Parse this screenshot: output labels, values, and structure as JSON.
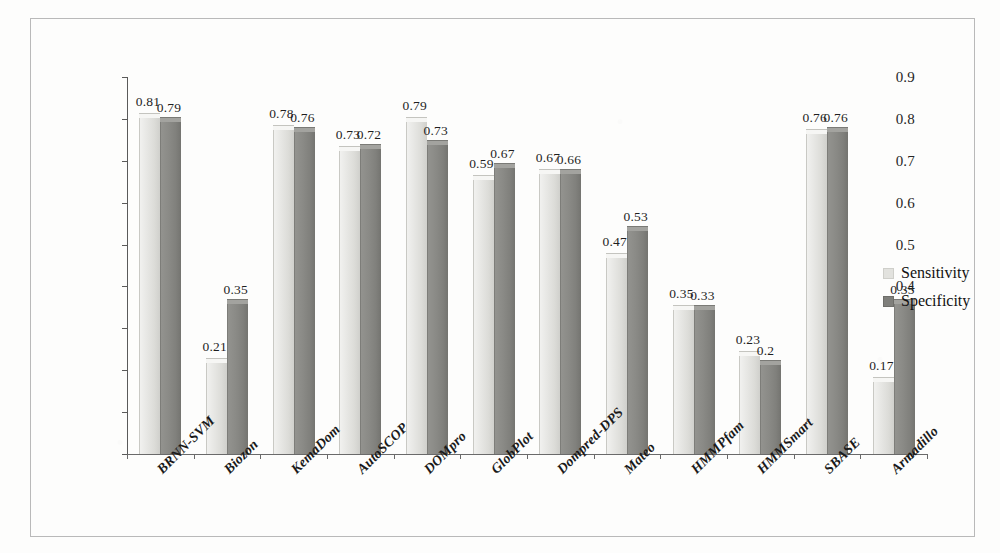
{
  "chart_data": {
    "type": "bar",
    "title": "",
    "xlabel": "",
    "ylabel": "",
    "ylim": [
      0,
      0.9
    ],
    "ytick_labels": [
      "0.9",
      "0.8",
      "0.7",
      "0.6",
      "0.5",
      "0.4",
      "0.3",
      "0.2",
      "0.1",
      "0"
    ],
    "ytick_values": [
      0.9,
      0.8,
      0.7,
      0.6,
      0.5,
      0.4,
      0.3,
      0.2,
      0.1,
      0
    ],
    "grid": false,
    "legend_position": "right",
    "categories": [
      "BRNN-SVM",
      "Biozon",
      "KemaDom",
      "AutoSCOP",
      "DOMpro",
      "GlobPlot",
      "Dompred-DPS",
      "Mateo",
      "HMMPfam",
      "HMMSmart",
      "SBASE",
      "Armadillo"
    ],
    "series": [
      {
        "name": "Sensitivity",
        "color": "#e6e6e3",
        "values": [
          0.81,
          0.21,
          0.78,
          0.73,
          0.79,
          0.59,
          0.67,
          0.47,
          0.35,
          0.23,
          0.76,
          0.17
        ],
        "bar_heights": [
          0.815,
          0.23,
          0.785,
          0.735,
          0.805,
          0.665,
          0.68,
          0.48,
          0.355,
          0.245,
          0.775,
          0.185
        ]
      },
      {
        "name": "Specificity",
        "color": "#8a8a86",
        "values": [
          0.79,
          0.35,
          0.76,
          0.72,
          0.73,
          0.67,
          0.66,
          0.53,
          0.33,
          0.2,
          0.76,
          0.35
        ],
        "bar_heights": [
          0.805,
          0.37,
          0.78,
          0.74,
          0.75,
          0.695,
          0.68,
          0.545,
          0.355,
          0.225,
          0.78,
          0.37
        ]
      }
    ]
  },
  "legend": {
    "items": [
      {
        "label": "Sensitivity",
        "swatch": "light"
      },
      {
        "label": "Specificity",
        "swatch": "dark"
      }
    ]
  }
}
